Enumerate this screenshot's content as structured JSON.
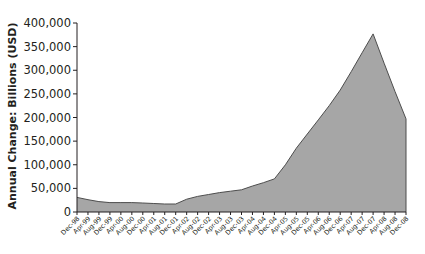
{
  "chart_data": {
    "type": "area",
    "title": "",
    "xlabel": "",
    "ylabel": "Annual Change: Billions (USD)",
    "ylim": [
      0,
      400000
    ],
    "yticks": [
      "0",
      "50,000",
      "100,000",
      "150,000",
      "200,000",
      "250,000",
      "300,000",
      "350,000",
      "400,000"
    ],
    "grid": false,
    "legend": null,
    "categories": [
      "Dec-98",
      "Apr-99",
      "Aug-99",
      "Dec-99",
      "Apr-00",
      "Aug-00",
      "Dec-00",
      "Apr-01",
      "Aug-01",
      "Dec-01",
      "Apr-02",
      "Aug-02",
      "Dec-02",
      "Apr-03",
      "Aug-03",
      "Dec-03",
      "Apr-04",
      "Aug-04",
      "Dec-04",
      "Apr-05",
      "Aug-05",
      "Dec-05",
      "Apr-06",
      "Aug-06",
      "Dec-06",
      "Apr-07",
      "Aug-07",
      "Dec-07",
      "Apr-08",
      "Aug-08",
      "Dec-08"
    ],
    "values": [
      31000,
      26000,
      22000,
      20000,
      20000,
      20000,
      19000,
      18000,
      17000,
      17000,
      27000,
      33000,
      37000,
      41000,
      44000,
      47000,
      55000,
      62000,
      70000,
      100000,
      135000,
      165000,
      195000,
      225000,
      258000,
      297000,
      337000,
      377000,
      315000,
      255000,
      197000
    ],
    "fill_color": "#a6a6a6",
    "line_color": "#4d4d4d"
  }
}
